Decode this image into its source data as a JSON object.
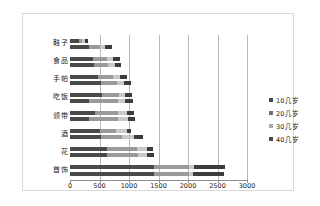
{
  "chart_data": {
    "type": "bar",
    "subtype": "stacked-horizontal-bar",
    "title": "",
    "xlabel": "",
    "ylabel": "",
    "xlim": [
      0,
      3000
    ],
    "xticks": [
      0,
      500,
      1000,
      1500,
      2000,
      2500,
      3000
    ],
    "grid": true,
    "legend_position": "right",
    "categories": [
      "鞋子",
      "食品",
      "手帕",
      "吃饭",
      "领带",
      "酒",
      "花",
      "首饰"
    ],
    "series": [
      {
        "name": "10几岁",
        "color": "#4a4a4a",
        "values": [
          150,
          320,
          390,
          400,
          480,
          520,
          630,
          1420
        ]
      },
      {
        "name": "20几岁",
        "color": "#9a9a9a",
        "values": [
          60,
          190,
          230,
          240,
          250,
          350,
          500,
          600
        ]
      },
      {
        "name": "30几岁",
        "color": "#c8c8c8",
        "values": [
          40,
          90,
          110,
          120,
          110,
          140,
          170,
          80
        ]
      },
      {
        "name": "40几岁",
        "color": "#3c3c3c",
        "values": [
          60,
          110,
          120,
          110,
          120,
          210,
          100,
          520
        ]
      }
    ],
    "rows": [
      {
        "category": "鞋子",
        "bars": [
          {
            "segments": [
              150,
              60,
              40,
              60
            ]
          },
          {
            "segments": [
              320,
              190,
              90,
              110
            ]
          }
        ]
      },
      {
        "category": "食品",
        "bars": [
          {
            "segments": [
              390,
              230,
              110,
              120
            ]
          },
          {
            "segments": [
              400,
              240,
              120,
              110
            ]
          }
        ]
      },
      {
        "category": "手帕",
        "bars": [
          {
            "segments": [
              480,
              250,
              110,
              120
            ]
          },
          {
            "segments": [
              520,
              280,
              120,
              110
            ]
          }
        ]
      },
      {
        "category": "吃饭",
        "bars": [
          {
            "segments": [
              540,
              290,
              110,
              110
            ]
          },
          {
            "segments": [
              330,
              480,
              130,
              120
            ]
          }
        ]
      },
      {
        "category": "领带",
        "bars": [
          {
            "segments": [
              420,
              400,
              140,
              120
            ]
          },
          {
            "segments": [
              330,
              490,
              160,
              120
            ]
          }
        ]
      },
      {
        "category": "酒",
        "bars": [
          {
            "segments": [
              500,
              280,
              180,
              80
            ]
          },
          {
            "segments": [
              520,
              360,
              200,
              160
            ]
          }
        ]
      },
      {
        "category": "花",
        "bars": [
          {
            "segments": [
              630,
              500,
              170,
              100
            ]
          },
          {
            "segments": [
              630,
              520,
              160,
              110
            ]
          }
        ]
      },
      {
        "category": "首饰",
        "bars": [
          {
            "segments": [
              1420,
              600,
              80,
              520
            ]
          },
          {
            "segments": [
              1420,
              600,
              70,
              520
            ]
          }
        ]
      }
    ]
  },
  "legend": {
    "items": [
      {
        "label": "10几岁",
        "color": "#4a4a4a"
      },
      {
        "label": "20几岁",
        "color": "#6e6e6e"
      },
      {
        "label": "30几岁",
        "color": "#a8a8a8"
      },
      {
        "label": "40几岁",
        "color": "#4a4a4a"
      }
    ]
  },
  "axis": {
    "tick_labels": [
      "0",
      "500",
      "1000",
      "1500",
      "2000",
      "2500",
      "3000"
    ]
  }
}
